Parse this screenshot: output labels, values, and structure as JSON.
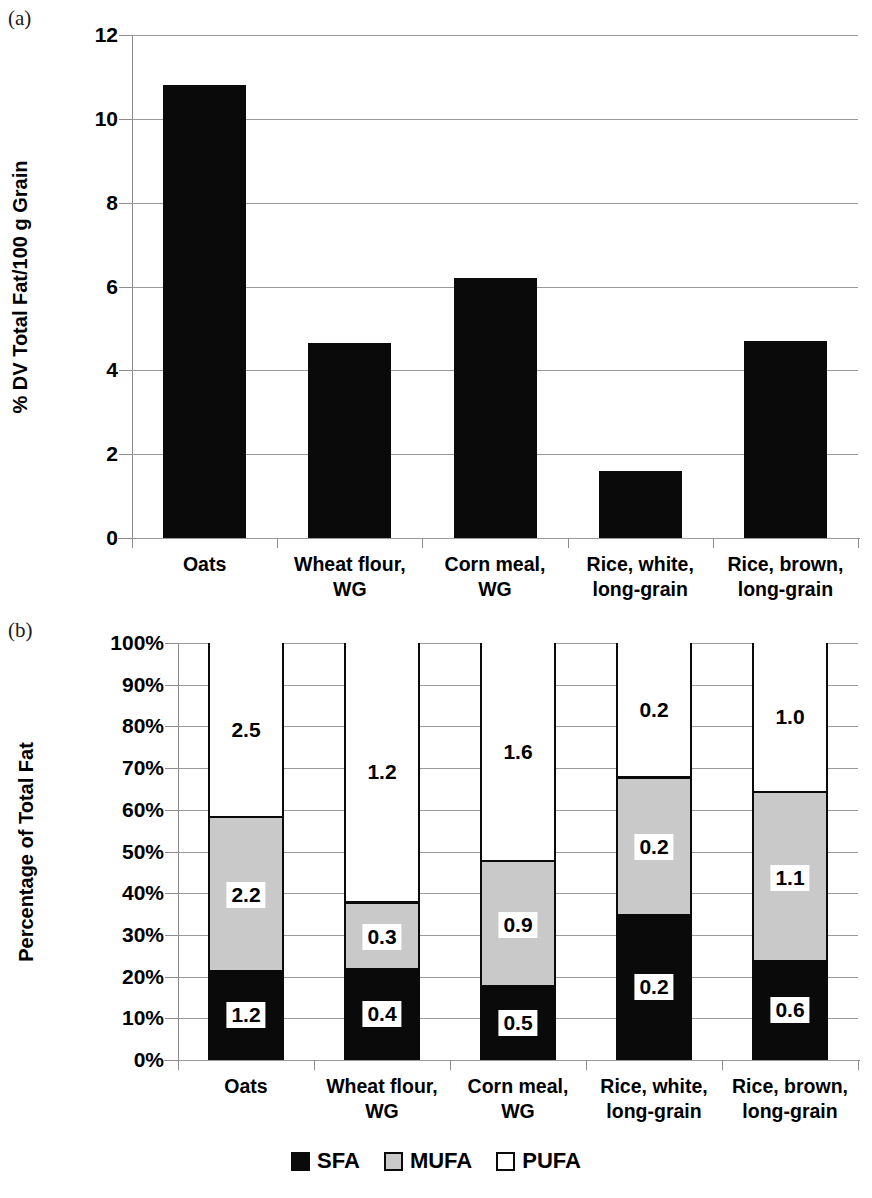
{
  "figure": {
    "panel_a_tag": "(a)",
    "panel_b_tag": "(b)"
  },
  "legend": {
    "items": [
      {
        "label": "SFA",
        "color": "#0a0a0a"
      },
      {
        "label": "MUFA",
        "color": "#c9c9c9"
      },
      {
        "label": "PUFA",
        "color": "#ffffff"
      }
    ]
  },
  "chart_data": [
    {
      "type": "bar",
      "panel": "(a)",
      "title": "",
      "xlabel": "",
      "ylabel": "% DV Total Fat/100 g Grain",
      "categories": [
        "Oats",
        "Wheat flour,\nWG",
        "Corn meal,\nWG",
        "Rice, white,\nlong-grain",
        "Rice, brown,\nlong-grain"
      ],
      "category_lines": [
        [
          "Oats"
        ],
        [
          "Wheat flour,",
          "WG"
        ],
        [
          "Corn meal,",
          "WG"
        ],
        [
          "Rice, white,",
          "long-grain"
        ],
        [
          "Rice, brown,",
          "long-grain"
        ]
      ],
      "values": [
        10.8,
        4.65,
        6.2,
        1.6,
        4.7
      ],
      "ylim": [
        0,
        12
      ],
      "yticks": [
        0,
        2,
        4,
        6,
        8,
        10,
        12
      ],
      "ytick_labels": [
        "0",
        "2",
        "4",
        "6",
        "8",
        "10",
        "12"
      ],
      "grid": true,
      "bar_color": "#0a0a0a"
    },
    {
      "type": "bar",
      "panel": "(b)",
      "stacked": true,
      "normalized": true,
      "title": "",
      "xlabel": "",
      "ylabel": "Percentage of Total Fat",
      "categories": [
        "Oats",
        "Wheat flour,\nWG",
        "Corn meal,\nWG",
        "Rice, white,\nlong-grain",
        "Rice, brown,\nlong-grain"
      ],
      "category_lines": [
        [
          "Oats"
        ],
        [
          "Wheat flour,",
          "WG"
        ],
        [
          "Corn meal,",
          "WG"
        ],
        [
          "Rice, white,",
          "long-grain"
        ],
        [
          "Rice, brown,",
          "long-grain"
        ]
      ],
      "ylim": [
        0,
        100
      ],
      "yticks": [
        0,
        10,
        20,
        30,
        40,
        50,
        60,
        70,
        80,
        90,
        100
      ],
      "ytick_labels": [
        "0%",
        "10%",
        "20%",
        "30%",
        "40%",
        "50%",
        "60%",
        "70%",
        "80%",
        "90%",
        "100%"
      ],
      "grid": true,
      "series": [
        {
          "name": "SFA",
          "color": "#0a0a0a",
          "percents": [
            20.5,
            21.0,
            17.0,
            34.0,
            23.0
          ],
          "labels": [
            "1.2",
            "0.4",
            "0.5",
            "0.2",
            "0.6"
          ]
        },
        {
          "name": "MUFA",
          "color": "#c9c9c9",
          "percents": [
            37.0,
            16.0,
            30.0,
            33.0,
            40.5
          ],
          "labels": [
            "2.2",
            "0.3",
            "0.9",
            "0.2",
            "1.1"
          ]
        },
        {
          "name": "PUFA",
          "color": "#ffffff",
          "percents": [
            42.5,
            63.0,
            53.0,
            33.0,
            36.5
          ],
          "labels": [
            "2.5",
            "1.2",
            "1.6",
            "0.2",
            "1.0"
          ]
        }
      ]
    }
  ]
}
